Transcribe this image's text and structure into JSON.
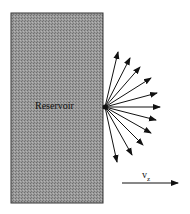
{
  "diagram": {
    "reservoir": {
      "label": "Reservoir",
      "x": 11,
      "y": 13,
      "w": 92,
      "h": 190,
      "fill": "#8a8a8a",
      "stroke": "#333333"
    },
    "origin": {
      "x": 105,
      "y": 107
    },
    "arrows": [
      {
        "x": 118,
        "y": 52
      },
      {
        "x": 130,
        "y": 58
      },
      {
        "x": 140,
        "y": 67
      },
      {
        "x": 151,
        "y": 78
      },
      {
        "x": 157,
        "y": 93
      },
      {
        "x": 160,
        "y": 107
      },
      {
        "x": 156,
        "y": 120
      },
      {
        "x": 151,
        "y": 133
      },
      {
        "x": 143,
        "y": 145
      },
      {
        "x": 132,
        "y": 155
      },
      {
        "x": 117,
        "y": 162
      }
    ],
    "velocity": {
      "label": "v",
      "subscript": "z",
      "x1": 122,
      "y1": 183,
      "x2": 178,
      "y2": 183
    }
  }
}
